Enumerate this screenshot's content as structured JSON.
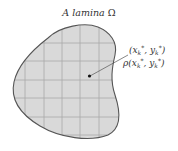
{
  "title": {
    "prefix": "A lamina",
    "symbol": "Ω"
  },
  "region": {
    "fill": "#d9d9d9",
    "stroke": "#555555",
    "grid_color": "#a8a8a8"
  },
  "point": {
    "var_x": "x",
    "var_y": "y",
    "sub": "k",
    "sup": "*",
    "density_fn": "ρ",
    "coord_label": "(x_k*, y_k*)",
    "density_label": "ρ(x_k*, y_k*)"
  }
}
